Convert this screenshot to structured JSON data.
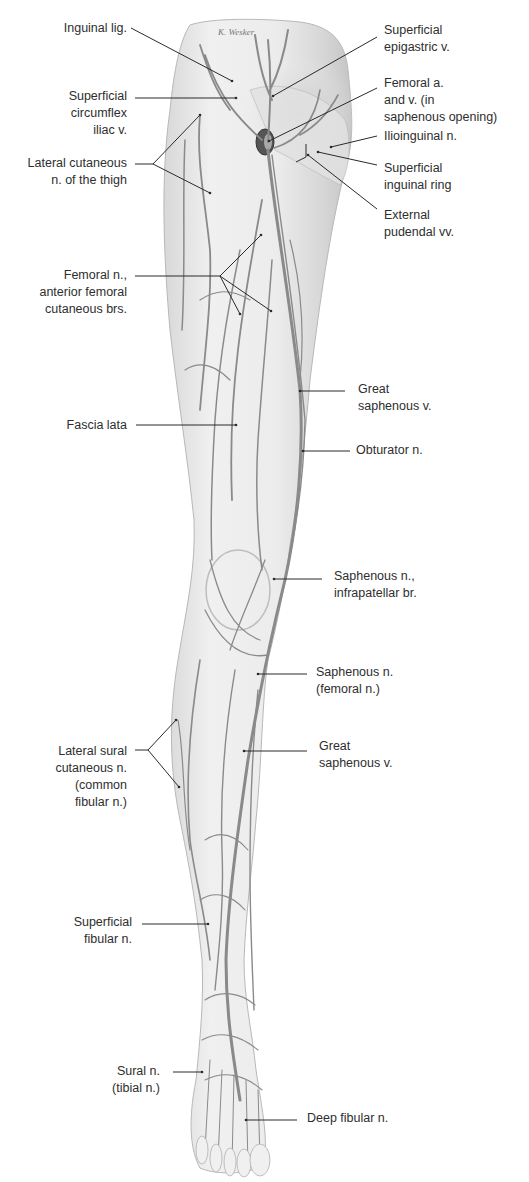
{
  "figure": {
    "title_fragment": "",
    "signature": "K. Wesker",
    "colors": {
      "background": "#ffffff",
      "skin_fill": "#ebebeb",
      "skin_shade": "#cfcfcf",
      "vessel": "#8a8a8a",
      "leader": "#2a2a2a",
      "text": "#2e2e2e"
    },
    "labels_left": [
      {
        "id": "inguinal-lig",
        "text": "Inguinal lig.",
        "x_right": 127,
        "y": 20,
        "leader": [
          [
            131,
            28
          ],
          [
            232,
            81
          ]
        ]
      },
      {
        "id": "superficial-circumflex-iliac-v",
        "text": "Superficial\ncircumflex\niliac v.",
        "x_right": 127,
        "y": 88,
        "leader": [
          [
            135,
            98
          ],
          [
            236,
            98
          ]
        ]
      },
      {
        "id": "lateral-cutaneous-n-thigh",
        "text": "Lateral cutaneous\nn. of the thigh",
        "x_right": 127,
        "y": 155,
        "leader": [
          [
            135,
            164
          ],
          [
            153,
            164
          ]
        ],
        "branches": [
          [
            [
              153,
              164
            ],
            [
              200,
              115
            ]
          ],
          [
            [
              153,
              164
            ],
            [
              210,
              193
            ]
          ]
        ]
      },
      {
        "id": "femoral-n-anterior-cutaneous",
        "text": "Femoral n.,\nanterior femoral\ncutaneous brs.",
        "x_right": 127,
        "y": 267,
        "leader": [
          [
            135,
            276
          ],
          [
            220,
            276
          ]
        ],
        "branches": [
          [
            [
              220,
              276
            ],
            [
              261,
              235
            ]
          ],
          [
            [
              220,
              276
            ],
            [
              240,
              314
            ]
          ],
          [
            [
              220,
              276
            ],
            [
              271,
              311
            ]
          ]
        ]
      },
      {
        "id": "fascia-lata",
        "text": "Fascia lata",
        "x_right": 127,
        "y": 417,
        "leader": [
          [
            136,
            425
          ],
          [
            236,
            425
          ]
        ]
      },
      {
        "id": "lateral-sural-cutaneous-n",
        "text": "Lateral sural\ncutaneous n.\n(common\nfibular n.)",
        "x_right": 127,
        "y": 743,
        "leader": [
          [
            135,
            750
          ],
          [
            148,
            750
          ]
        ],
        "branches": [
          [
            [
              148,
              750
            ],
            [
              176,
              720
            ]
          ],
          [
            [
              148,
              750
            ],
            [
              179,
              787
            ]
          ]
        ]
      },
      {
        "id": "superficial-fibular-n",
        "text": "Superficial\nfibular n.",
        "x_right": 132,
        "y": 914,
        "leader": [
          [
            142,
            924
          ],
          [
            208,
            924
          ]
        ]
      },
      {
        "id": "sural-n",
        "text": "Sural n.\n(tibial n.)",
        "x_right": 160,
        "y": 1063,
        "leader": [
          [
            173,
            1072
          ],
          [
            202,
            1072
          ]
        ]
      }
    ],
    "labels_right": [
      {
        "id": "superficial-epigastric-v",
        "text": "Superficial\nepigastric v.",
        "x_left": 384,
        "y": 22,
        "leader": [
          [
            377,
            37
          ],
          [
            273,
            96
          ]
        ]
      },
      {
        "id": "femoral-a-and-v",
        "text": "Femoral a.\nand v. (in\nsaphenous opening)",
        "x_left": 384,
        "y": 75,
        "leader": [
          [
            377,
            88
          ],
          [
            269,
            141
          ]
        ]
      },
      {
        "id": "ilioinguinal-n",
        "text": "Ilioinguinal n.",
        "x_left": 384,
        "y": 128,
        "leader": [
          [
            377,
            136
          ],
          [
            331,
            147
          ]
        ]
      },
      {
        "id": "superficial-inguinal-ring",
        "text": "Superficial\ninguinal ring",
        "x_left": 384,
        "y": 160,
        "leader": [
          [
            377,
            165
          ],
          [
            318,
            152
          ]
        ]
      },
      {
        "id": "external-pudendal-vv",
        "text": "External\npudendal vv.",
        "x_left": 384,
        "y": 207,
        "leader": [
          [
            377,
            209
          ],
          [
            308,
            155
          ]
        ],
        "bracket": [
          [
            [
              306,
              144
            ],
            [
              306,
              157
            ]
          ],
          [
            [
              306,
              157
            ],
            [
              296,
              162
            ]
          ]
        ]
      },
      {
        "id": "great-saphenous-v-upper",
        "text": "Great\nsaphenous v.",
        "x_left": 358,
        "y": 381,
        "leader": [
          [
            345,
            391
          ],
          [
            300,
            391
          ]
        ]
      },
      {
        "id": "obturator-n",
        "text": "Obturator n.",
        "x_left": 356,
        "y": 442,
        "leader": [
          [
            350,
            451
          ],
          [
            303,
            451
          ]
        ]
      },
      {
        "id": "saphenous-n-infrapatellar",
        "text": "Saphenous n.,\ninfrapatellar br.",
        "x_left": 334,
        "y": 568,
        "leader": [
          [
            322,
            579
          ],
          [
            274,
            579
          ]
        ]
      },
      {
        "id": "saphenous-n-femoral",
        "text": "Saphenous n.\n(femoral n.)",
        "x_left": 316,
        "y": 664,
        "leader": [
          [
            307,
            674
          ],
          [
            258,
            674
          ]
        ]
      },
      {
        "id": "great-saphenous-v-lower",
        "text": "Great\nsaphenous v.",
        "x_left": 319,
        "y": 738,
        "leader": [
          [
            307,
            751
          ],
          [
            244,
            751
          ]
        ]
      },
      {
        "id": "deep-fibular-n",
        "text": "Deep fibular n.",
        "x_left": 307,
        "y": 1110,
        "leader": [
          [
            297,
            1120
          ],
          [
            246,
            1120
          ]
        ]
      }
    ]
  }
}
